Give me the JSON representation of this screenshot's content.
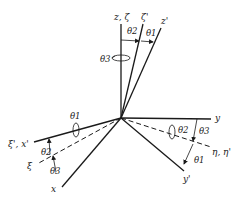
{
  "diagram": {
    "type": "euler-angle-rotation-axes",
    "origin": {
      "x": 121,
      "y": 118
    },
    "colors": {
      "line": "#1a1a1a",
      "background": "#ffffff"
    },
    "axes": [
      {
        "id": "z",
        "label": "z, ζ",
        "style": "solid"
      },
      {
        "id": "zeta-prime",
        "label": "ζ'",
        "style": "solid"
      },
      {
        "id": "z-prime",
        "label": "z'",
        "style": "solid"
      },
      {
        "id": "y",
        "label": "y",
        "style": "solid"
      },
      {
        "id": "eta",
        "label": "η, η'",
        "style": "dashed"
      },
      {
        "id": "y-prime",
        "label": "y'",
        "style": "solid"
      },
      {
        "id": "xi-prime",
        "label": "ξ', x'",
        "style": "solid"
      },
      {
        "id": "xi",
        "label": "ξ",
        "style": "dashed"
      },
      {
        "id": "x",
        "label": "x",
        "style": "solid"
      }
    ],
    "angles": {
      "top_theta2": "θ2",
      "top_theta1": "θ1",
      "top_theta3": "θ3",
      "left_theta1": "θ1",
      "left_theta2": "θ2",
      "left_theta3": "θ3",
      "right_theta2": "θ2",
      "right_theta3": "θ3",
      "right_theta1": "θ1"
    }
  }
}
